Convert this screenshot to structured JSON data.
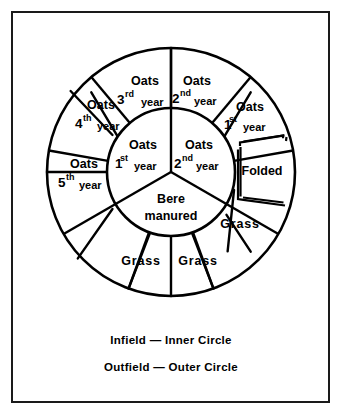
{
  "figure": {
    "caption": {
      "line1": "Infield — Inner Circle",
      "line2": "Outfield — Outer Circle"
    },
    "colors": {
      "ink": "#000000",
      "background": "#ffffff",
      "frame": "#1a1a1a"
    },
    "geometry": {
      "center_x": 171,
      "center_y": 172,
      "outer_radius": 124,
      "inner_radius": 64,
      "outer_segment_count": 9,
      "inner_segment_count": 3,
      "outer_segment_degrees": 40,
      "inner_segment_degrees": 120
    },
    "inner_circle": {
      "name": "Infield",
      "segments": [
        {
          "id": "inner-oats-1st",
          "main": "Oats",
          "ordinal_number": "1",
          "ordinal_suffix": "st",
          "unit": "year"
        },
        {
          "id": "inner-oats-2nd",
          "main": "Oats",
          "ordinal_number": "2",
          "ordinal_suffix": "nd",
          "unit": "year"
        },
        {
          "id": "inner-bere-manured",
          "main": "Bere",
          "sub": "manured"
        }
      ]
    },
    "outer_ring": {
      "name": "Outfield",
      "segments": [
        {
          "id": "outer-oats-2nd",
          "main": "Oats",
          "ordinal_number": "2",
          "ordinal_suffix": "nd",
          "unit": "year"
        },
        {
          "id": "outer-oats-1st",
          "main": "Oats",
          "ordinal_number": "1",
          "ordinal_suffix": "st",
          "unit": "year"
        },
        {
          "id": "outer-folded",
          "main": "Folded",
          "has_inset_outline": true
        },
        {
          "id": "outer-grass-1",
          "main": "Grass"
        },
        {
          "id": "outer-grass-2",
          "main": "Grass"
        },
        {
          "id": "outer-grass-3",
          "main": "Grass"
        },
        {
          "id": "outer-oats-5th",
          "main": "Oats",
          "ordinal_number": "5",
          "ordinal_suffix": "th",
          "unit": "year"
        },
        {
          "id": "outer-oats-4th",
          "main": "Oats",
          "ordinal_number": "4",
          "ordinal_suffix": "th",
          "unit": "year"
        },
        {
          "id": "outer-oats-3rd",
          "main": "Oats",
          "ordinal_number": "3",
          "ordinal_suffix": "rd",
          "unit": "year"
        }
      ]
    }
  }
}
